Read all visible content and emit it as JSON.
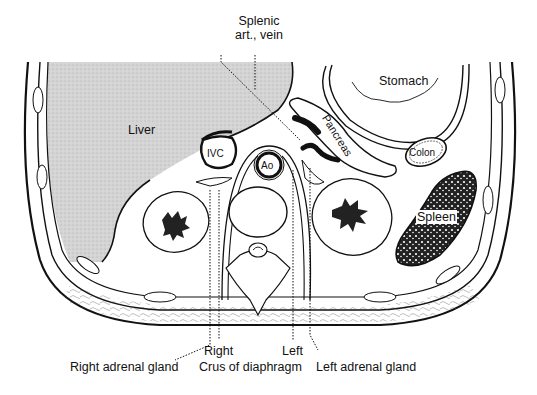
{
  "figure": {
    "colors": {
      "ink": "#111111",
      "liver_fill": "#cfcfcf",
      "background": "#ffffff",
      "spleen_fill": "#2a2a2a"
    }
  },
  "labels": {
    "splenic_line1": "Splenic",
    "splenic_line2": "art., vein",
    "stomach": "Stomach",
    "liver": "Liver",
    "pancreas": "Pancreas",
    "ivc": "IVC",
    "aorta": "Ao",
    "colon": "Colon",
    "spleen": "Spleen",
    "right_adrenal": "Right adrenal gland",
    "crus_right": "Right",
    "crus_left": "Left",
    "crus_of_diaphragm": "Crus of diaphragm",
    "left_adrenal": "Left adrenal gland"
  }
}
